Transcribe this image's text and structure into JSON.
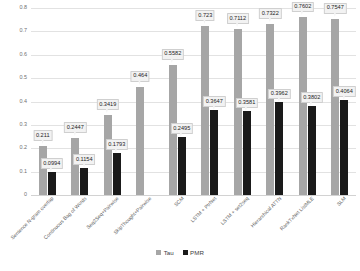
{
  "chart_data": {
    "type": "bar",
    "title": "",
    "xlabel": "",
    "ylabel": "",
    "ylim": [
      0,
      0.8
    ],
    "ytick_values": [
      0,
      0.1,
      0.2,
      0.3,
      0.4,
      0.5,
      0.6,
      0.7,
      0.8
    ],
    "ytick_labels": [
      "0",
      "0.1",
      "0.2",
      "0.3",
      "0.4",
      "0.5",
      "0.6",
      "0.7",
      "0.8"
    ],
    "grid": true,
    "legend_position": "bottom",
    "categories": [
      "Sentence N-gram overlap",
      "Continuous Bag of Words",
      "Seq2Seq+Pairwise",
      "SkipThought+Pairwise",
      "SCM",
      "LSTM + PtrNet",
      "LSTM + set2seq",
      "Hierarchical ATTN",
      "RankTxNet ListMLE",
      "SLM"
    ],
    "series": [
      {
        "name": "Tau",
        "color": "#a6a6a6",
        "values": [
          0.211,
          0.2447,
          0.3419,
          0.464,
          0.5582,
          0.723,
          0.7112,
          0.7322,
          0.7602,
          0.7547
        ],
        "labels": [
          "0.211",
          "0.2447",
          "0.3419",
          "0.464",
          "0.5582",
          "0.723",
          "0.7112",
          "0.7322",
          "0.7602",
          "0.7547"
        ]
      },
      {
        "name": "PMR",
        "color": "#1a1a1a",
        "values": [
          0.0994,
          0.1154,
          0.1793,
          null,
          0.2495,
          0.3647,
          0.3581,
          0.3962,
          0.3802,
          0.4064
        ],
        "labels": [
          "0.0994",
          "0.1154",
          "0.1793",
          "",
          "0.2495",
          "0.3647",
          "0.3581",
          "0.3962",
          "0.3802",
          "0.4064"
        ]
      }
    ]
  },
  "legend": {
    "items": [
      {
        "label": "Tau"
      },
      {
        "label": "PMR"
      }
    ]
  }
}
